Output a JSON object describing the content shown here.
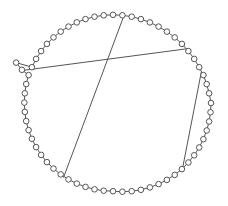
{
  "figure": {
    "width": 228,
    "height": 206,
    "background_color": "#ffffff"
  },
  "style": {
    "node_fill": "#ffffff",
    "node_stroke": "#555555",
    "node_radius": 2.8,
    "node_stroke_width": 1,
    "edge_color": "#555555",
    "edge_width": 1
  },
  "chart_data": {
    "type": "scatter",
    "xlabel": "",
    "ylabel": "",
    "grid": false,
    "legend": null,
    "xlim": [
      0,
      228
    ],
    "ylim": [
      0,
      206
    ],
    "layout": "circular",
    "center": [
      113,
      103
    ],
    "radius_x": 98,
    "radius_y": 89,
    "node_count": 60,
    "nodes": [
      {
        "id": 0,
        "x": 211.0,
        "y": 103.0
      },
      {
        "id": 1,
        "x": 210.5,
        "y": 112.3
      },
      {
        "id": 2,
        "x": 209.1,
        "y": 121.5
      },
      {
        "id": 3,
        "x": 206.7,
        "y": 130.5
      },
      {
        "id": 4,
        "x": 203.4,
        "y": 139.2
      },
      {
        "id": 5,
        "x": 199.2,
        "y": 147.5
      },
      {
        "id": 6,
        "x": 194.2,
        "y": 155.3
      },
      {
        "id": 7,
        "x": 188.4,
        "y": 162.5
      },
      {
        "id": 8,
        "x": 181.9,
        "y": 169.1
      },
      {
        "id": 9,
        "x": 174.7,
        "y": 174.9
      },
      {
        "id": 10,
        "x": 166.9,
        "y": 179.9
      },
      {
        "id": 11,
        "x": 158.6,
        "y": 184.1
      },
      {
        "id": 12,
        "x": 149.9,
        "y": 187.4
      },
      {
        "id": 13,
        "x": 140.9,
        "y": 189.8
      },
      {
        "id": 14,
        "x": 131.7,
        "y": 191.2
      },
      {
        "id": 15,
        "x": 122.4,
        "y": 191.7
      },
      {
        "id": 16,
        "x": 113.0,
        "y": 191.2
      },
      {
        "id": 17,
        "x": 103.7,
        "y": 190.7
      },
      {
        "id": 18,
        "x": 94.5,
        "y": 189.3
      },
      {
        "id": 19,
        "x": 85.5,
        "y": 186.9
      },
      {
        "id": 20,
        "x": 76.8,
        "y": 183.6
      },
      {
        "id": 21,
        "x": 68.5,
        "y": 179.4
      },
      {
        "id": 22,
        "x": 60.7,
        "y": 174.4
      },
      {
        "id": 23,
        "x": 53.5,
        "y": 168.6
      },
      {
        "id": 24,
        "x": 46.9,
        "y": 162.1
      },
      {
        "id": 25,
        "x": 41.1,
        "y": 154.9
      },
      {
        "id": 26,
        "x": 36.1,
        "y": 147.1
      },
      {
        "id": 27,
        "x": 31.9,
        "y": 138.8
      },
      {
        "id": 28,
        "x": 28.6,
        "y": 130.1
      },
      {
        "id": 29,
        "x": 26.2,
        "y": 121.1
      },
      {
        "id": 30,
        "x": 24.8,
        "y": 111.9
      },
      {
        "id": 31,
        "x": 24.3,
        "y": 102.6
      },
      {
        "id": 32,
        "x": 24.8,
        "y": 93.3
      },
      {
        "id": 33,
        "x": 26.2,
        "y": 84.1
      },
      {
        "id": 34,
        "x": 28.6,
        "y": 75.1
      },
      {
        "id": 35,
        "x": 21.9,
        "y": 69.8
      },
      {
        "id": 36,
        "x": 16.1,
        "y": 62.6
      },
      {
        "id": 37,
        "x": 31.9,
        "y": 67.2
      },
      {
        "id": 38,
        "x": 36.1,
        "y": 58.9
      },
      {
        "id": 39,
        "x": 41.1,
        "y": 51.1
      },
      {
        "id": 40,
        "x": 46.9,
        "y": 43.9
      },
      {
        "id": 41,
        "x": 53.5,
        "y": 37.4
      },
      {
        "id": 42,
        "x": 60.7,
        "y": 31.6
      },
      {
        "id": 43,
        "x": 68.5,
        "y": 26.6
      },
      {
        "id": 44,
        "x": 76.8,
        "y": 22.4
      },
      {
        "id": 45,
        "x": 85.5,
        "y": 19.1
      },
      {
        "id": 46,
        "x": 94.5,
        "y": 16.7
      },
      {
        "id": 47,
        "x": 103.7,
        "y": 15.3
      },
      {
        "id": 48,
        "x": 113.0,
        "y": 14.8
      },
      {
        "id": 49,
        "x": 122.4,
        "y": 15.3
      },
      {
        "id": 50,
        "x": 131.7,
        "y": 16.7
      },
      {
        "id": 51,
        "x": 140.9,
        "y": 19.1
      },
      {
        "id": 52,
        "x": 149.9,
        "y": 22.4
      },
      {
        "id": 53,
        "x": 158.6,
        "y": 26.6
      },
      {
        "id": 54,
        "x": 166.9,
        "y": 31.6
      },
      {
        "id": 55,
        "x": 174.7,
        "y": 37.4
      },
      {
        "id": 56,
        "x": 181.9,
        "y": 43.9
      },
      {
        "id": 57,
        "x": 188.4,
        "y": 51.1
      },
      {
        "id": 58,
        "x": 194.2,
        "y": 58.9
      },
      {
        "id": 59,
        "x": 199.2,
        "y": 67.2
      },
      {
        "id": 60,
        "x": 203.4,
        "y": 75.1
      },
      {
        "id": 61,
        "x": 206.7,
        "y": 84.1
      },
      {
        "id": 62,
        "x": 209.1,
        "y": 93.3
      }
    ],
    "chords": [
      {
        "name": "chord-long-diagonal",
        "x1": 124.0,
        "y1": 15.5,
        "x2": 63.5,
        "y2": 177.5
      },
      {
        "name": "chord-upper-horizontal",
        "x1": 22.0,
        "y1": 70.5,
        "x2": 189.0,
        "y2": 48.5
      },
      {
        "name": "chord-right-vertical",
        "x1": 201.5,
        "y1": 71.0,
        "x2": 183.0,
        "y2": 166.0
      }
    ]
  }
}
